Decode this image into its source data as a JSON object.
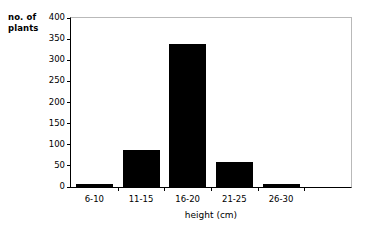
{
  "chart_data": {
    "type": "bar",
    "title": "",
    "xlabel": "height (cm)",
    "ylabel": "no. of plants",
    "categories": [
      "6-10",
      "11-15",
      "16-20",
      "21-25",
      "26-30"
    ],
    "values": [
      7,
      87,
      339,
      59,
      6
    ],
    "ylim": [
      0,
      400
    ],
    "yticks": [
      0,
      50,
      100,
      150,
      200,
      250,
      300,
      350,
      400
    ],
    "ytick_labels": [
      "0",
      "50",
      "100",
      "150",
      "200",
      "250",
      "300",
      "350",
      "400"
    ],
    "grid": false,
    "legend": null,
    "bar_color": "#000000",
    "axis_color": "#000000",
    "frame_color": "#b9b9b9",
    "background": "#ffffff"
  },
  "labels": {
    "y_title_line1": "no. of",
    "y_title_line2": "plants",
    "x_title": "height (cm)"
  }
}
